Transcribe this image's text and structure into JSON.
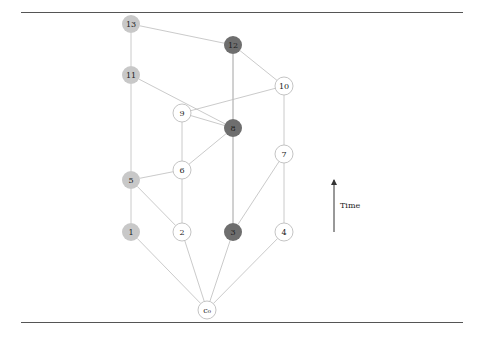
{
  "figure": {
    "time_axis_label": "Time",
    "colors": {
      "light_gray": "#c8c8c8",
      "dark_gray": "#6e6e6e",
      "white": "#ffffff",
      "edge": "#bdbdbd",
      "edge_dark": "#8a8a8a",
      "rule": "#555555"
    },
    "nodes": [
      {
        "id": "c0",
        "label": "c₀",
        "x": 207,
        "y": 310,
        "fill": "white"
      },
      {
        "id": "1",
        "label": "1",
        "x": 131,
        "y": 232,
        "fill": "light"
      },
      {
        "id": "2",
        "label": "2",
        "x": 182,
        "y": 232,
        "fill": "white"
      },
      {
        "id": "3",
        "label": "3",
        "x": 233,
        "y": 232,
        "fill": "dark"
      },
      {
        "id": "4",
        "label": "4",
        "x": 284,
        "y": 232,
        "fill": "white"
      },
      {
        "id": "5",
        "label": "5",
        "x": 131,
        "y": 180,
        "fill": "light"
      },
      {
        "id": "6",
        "label": "6",
        "x": 182,
        "y": 170,
        "fill": "white"
      },
      {
        "id": "7",
        "label": "7",
        "x": 284,
        "y": 154,
        "fill": "white"
      },
      {
        "id": "8",
        "label": "8",
        "x": 233,
        "y": 128,
        "fill": "dark"
      },
      {
        "id": "9",
        "label": "9",
        "x": 182,
        "y": 113,
        "fill": "white"
      },
      {
        "id": "10",
        "label": "10",
        "x": 284,
        "y": 86,
        "fill": "white"
      },
      {
        "id": "11",
        "label": "11",
        "x": 131,
        "y": 75,
        "fill": "light"
      },
      {
        "id": "12",
        "label": "12",
        "x": 233,
        "y": 45,
        "fill": "dark"
      },
      {
        "id": "13",
        "label": "13",
        "x": 131,
        "y": 24,
        "fill": "light"
      }
    ],
    "edges": [
      {
        "from": "c0",
        "to": "1"
      },
      {
        "from": "c0",
        "to": "2"
      },
      {
        "from": "c0",
        "to": "3"
      },
      {
        "from": "c0",
        "to": "4"
      },
      {
        "from": "1",
        "to": "5"
      },
      {
        "from": "2",
        "to": "5"
      },
      {
        "from": "2",
        "to": "6"
      },
      {
        "from": "3",
        "to": "8"
      },
      {
        "from": "3",
        "to": "7"
      },
      {
        "from": "4",
        "to": "7"
      },
      {
        "from": "6",
        "to": "5"
      },
      {
        "from": "6",
        "to": "9"
      },
      {
        "from": "8",
        "to": "6"
      },
      {
        "from": "8",
        "to": "9"
      },
      {
        "from": "8",
        "to": "12"
      },
      {
        "from": "7",
        "to": "10"
      },
      {
        "from": "10",
        "to": "9"
      },
      {
        "from": "5",
        "to": "11"
      },
      {
        "from": "11",
        "to": "8"
      },
      {
        "from": "11",
        "to": "13"
      },
      {
        "from": "10",
        "to": "12"
      },
      {
        "from": "13",
        "to": "12"
      }
    ]
  }
}
